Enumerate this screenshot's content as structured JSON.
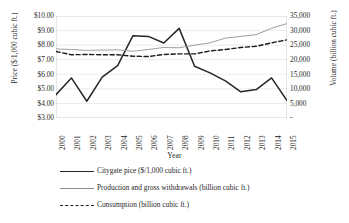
{
  "chart_data": {
    "type": "line",
    "title": "",
    "xlabel": "Year",
    "ylabel_left": "Price ($/1,000 cubic ft.)",
    "ylabel_right": "Volume (billion cubic ft.)",
    "grid": true,
    "legend_position": "bottom",
    "categories": [
      "2000",
      "2001",
      "2002",
      "2003",
      "2004",
      "2005",
      "2006",
      "2007",
      "2008",
      "2009",
      "2010",
      "2011",
      "2012",
      "2013",
      "2014",
      "2015"
    ],
    "x": [
      2000,
      2001,
      2002,
      2003,
      2004,
      2005,
      2006,
      2007,
      2008,
      2009,
      2010,
      2011,
      2012,
      2013,
      2014,
      2015
    ],
    "ylim_left": [
      3.0,
      10.0
    ],
    "ylim_right": [
      0,
      35000
    ],
    "yticks_left": [
      "$3.00",
      "$4.00",
      "$5.00",
      "$6.00",
      "$7.00",
      "$8.00",
      "$9.00",
      "$10.00"
    ],
    "ytick_values_left": [
      3,
      4,
      5,
      6,
      7,
      8,
      9,
      10
    ],
    "yticks_right": [
      "-",
      "5,000",
      "10,000",
      "15,000",
      "20,000",
      "25,000",
      "30,000",
      "35,000"
    ],
    "ytick_values_right": [
      0,
      5000,
      10000,
      15000,
      20000,
      25000,
      30000,
      35000
    ],
    "series": [
      {
        "name": "Citygate pice ($/1,000 cubic ft.)",
        "axis": "left",
        "style": "solid",
        "color": "#262626",
        "values": [
          4.6,
          5.75,
          4.15,
          5.8,
          6.6,
          8.65,
          8.6,
          8.15,
          9.15,
          6.55,
          6.1,
          5.55,
          4.8,
          4.95,
          5.75,
          4.2
        ]
      },
      {
        "name": "Production and gross withdrawals  (billion cubic ft.)",
        "axis": "right",
        "style": "thin",
        "color": "#8d8d8d",
        "values": [
          23700,
          23500,
          23200,
          23300,
          23400,
          22900,
          23500,
          24200,
          24100,
          25000,
          25800,
          27400,
          28000,
          28600,
          30800,
          32400
        ]
      },
      {
        "name": "Consumption (billion cubic ft.)",
        "axis": "right",
        "style": "dashed",
        "color": "#1c1c1c",
        "values": [
          22800,
          21700,
          21800,
          21700,
          21700,
          21200,
          21100,
          21800,
          22000,
          22000,
          23000,
          23500,
          24200,
          24600,
          25800,
          26800
        ]
      }
    ]
  }
}
